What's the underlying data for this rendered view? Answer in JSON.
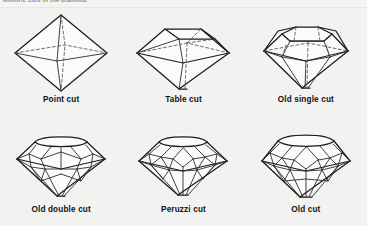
{
  "figure": {
    "top_caption": "Historic cuts of the diamond",
    "background_color": "#f2f2f0",
    "line_color": "#1b1b1b",
    "hidden_line_color": "#555555",
    "caption_color": "#111111"
  },
  "cuts": [
    {
      "id": "point-cut",
      "label": "Point cut",
      "shape": "octahedron",
      "description": "Natural octahedral crystal form, polished on its eight faces"
    },
    {
      "id": "table-cut",
      "label": "Table cut",
      "shape": "octahedron with flattened top table",
      "description": "Point cut with the upper point ground away to form a square table"
    },
    {
      "id": "old-single-cut",
      "label": "Old single cut",
      "shape": "brilliant with eight crown and eight pavilion facets",
      "description": "Table cut with the four corners bevelled, giving eight crown facets"
    },
    {
      "id": "old-double-cut",
      "label": "Old double cut",
      "shape": "brilliant with sixteen crown facets",
      "description": "Mazarin style with a doubled row of crown facets"
    },
    {
      "id": "peruzzi-cut",
      "label": "Peruzzi cut",
      "shape": "triple-cut brilliant, thirty-two crown facets",
      "description": "Early triple cut brilliant attributed to Vincenzo Peruzzi"
    },
    {
      "id": "old-cut",
      "label": "Old cut",
      "shape": "old European cushion brilliant",
      "description": "Old European cut with high crown, small table and large culet"
    }
  ]
}
